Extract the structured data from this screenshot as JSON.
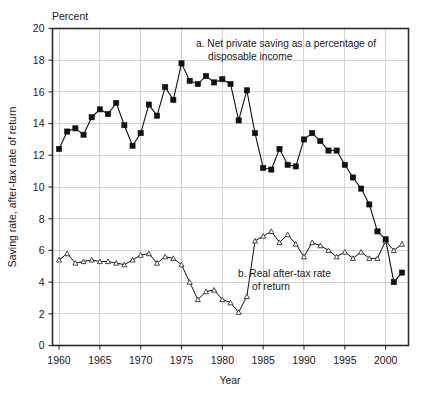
{
  "chart_data": {
    "type": "line",
    "title": "",
    "xlabel": "Year",
    "ylabel": "Saving rate, after-tax rate of return",
    "unit_label": "Percent",
    "xlim": [
      1959.2,
      2002.8
    ],
    "ylim": [
      0,
      20
    ],
    "xticks": [
      1960,
      1965,
      1970,
      1975,
      1980,
      1985,
      1990,
      1995,
      2000
    ],
    "yticks": [
      0,
      2,
      4,
      6,
      8,
      10,
      12,
      14,
      16,
      18,
      20
    ],
    "grid": "both",
    "legend_position": "inline-annotations",
    "annotations": [
      {
        "id": "series-a-annotation",
        "line1": "a. Net private saving as a percentage of",
        "line2": "disposable income",
        "x": 1980.5,
        "y": 19.1
      },
      {
        "id": "series-b-annotation",
        "line1": "b. Real after-tax rate",
        "line2": "of return",
        "x": 1984.4,
        "y": 5.05
      }
    ],
    "series": [
      {
        "name": "a. Net private saving as a percentage of disposable income",
        "marker": "filled-square",
        "x": [
          1960,
          1961,
          1962,
          1963,
          1964,
          1965,
          1966,
          1967,
          1968,
          1969,
          1970,
          1971,
          1972,
          1973,
          1974,
          1975,
          1976,
          1977,
          1978,
          1979,
          1980,
          1981,
          1982,
          1983,
          1984,
          1985,
          1986,
          1987,
          1988,
          1989,
          1990,
          1991,
          1992,
          1993,
          1994,
          1995,
          1996,
          1997,
          1998,
          1999,
          2000,
          2001,
          2002
        ],
        "values": [
          12.4,
          13.5,
          13.7,
          13.3,
          14.4,
          14.9,
          14.6,
          15.3,
          13.9,
          12.6,
          13.4,
          15.2,
          14.5,
          16.3,
          15.5,
          17.8,
          16.7,
          16.5,
          17.0,
          16.6,
          16.8,
          16.5,
          14.2,
          16.1,
          13.4,
          11.2,
          11.1,
          12.4,
          11.4,
          11.3,
          13.0,
          13.4,
          12.9,
          12.3,
          12.3,
          11.4,
          10.6,
          9.9,
          8.9,
          7.2,
          6.7,
          4.0,
          4.6
        ]
      },
      {
        "name": "b. Real after-tax rate of return",
        "marker": "open-triangle",
        "x": [
          1960,
          1961,
          1962,
          1963,
          1964,
          1965,
          1966,
          1967,
          1968,
          1969,
          1970,
          1971,
          1972,
          1973,
          1974,
          1975,
          1976,
          1977,
          1978,
          1979,
          1980,
          1981,
          1982,
          1983,
          1984,
          1985,
          1986,
          1987,
          1988,
          1989,
          1990,
          1991,
          1992,
          1993,
          1994,
          1995,
          1996,
          1997,
          1998,
          1999,
          2000,
          2001,
          2002
        ],
        "values": [
          5.4,
          5.8,
          5.2,
          5.3,
          5.4,
          5.3,
          5.3,
          5.2,
          5.1,
          5.4,
          5.7,
          5.8,
          5.2,
          5.6,
          5.5,
          5.1,
          4.0,
          2.9,
          3.4,
          3.5,
          2.9,
          2.7,
          2.1,
          3.1,
          6.6,
          6.9,
          7.2,
          6.5,
          7.0,
          6.4,
          5.6,
          6.5,
          6.3,
          6.0,
          5.6,
          5.9,
          5.5,
          5.9,
          5.5,
          5.5,
          6.6,
          6.0,
          6.4
        ]
      }
    ]
  }
}
